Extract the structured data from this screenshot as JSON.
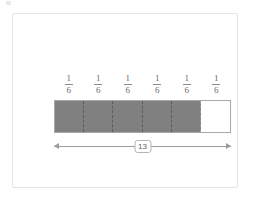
{
  "figure": {
    "background_color": "#ffffff",
    "frame_border_color": "#e4e4e4",
    "shaded_color": "#808080",
    "unshaded_color": "#ffffff",
    "outline_color": "#a8a8a8",
    "divider_color": "#5c5c5c",
    "arrow_color": "#9b9b9b"
  },
  "labels": [
    {
      "numerator": "1",
      "denominator": "6"
    },
    {
      "numerator": "1",
      "denominator": "6"
    },
    {
      "numerator": "1",
      "denominator": "6"
    },
    {
      "numerator": "1",
      "denominator": "6"
    },
    {
      "numerator": "1",
      "denominator": "6"
    },
    {
      "numerator": "1",
      "denominator": "6"
    }
  ],
  "bar": {
    "total_segments": 6,
    "shaded_segments": 5,
    "segments": [
      {
        "state": "shaded"
      },
      {
        "state": "shaded"
      },
      {
        "state": "shaded"
      },
      {
        "state": "shaded"
      },
      {
        "state": "shaded"
      },
      {
        "state": "unshaded"
      }
    ]
  },
  "measurement": {
    "value": "13",
    "style": "double-headed-arrow"
  },
  "chart_data": {
    "type": "bar",
    "title": "",
    "xlabel": "",
    "ylabel": "",
    "categories": [
      "1/6",
      "1/6",
      "1/6",
      "1/6",
      "1/6",
      "1/6"
    ],
    "values": [
      1,
      1,
      1,
      1,
      1,
      0
    ],
    "total_label": "13"
  }
}
